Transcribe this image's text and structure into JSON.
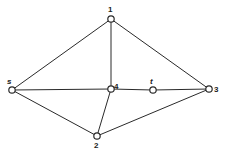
{
  "graph": {
    "type": "undirected",
    "nodes": [
      {
        "id": "1",
        "label": "1",
        "x": 111,
        "y": 19,
        "lx": 110,
        "ly": 11
      },
      {
        "id": "s",
        "label": "s",
        "x": 12,
        "y": 90,
        "lx": 9,
        "ly": 83
      },
      {
        "id": "4",
        "label": "4",
        "x": 111,
        "y": 89,
        "lx": 115,
        "ly": 88
      },
      {
        "id": "t",
        "label": "t",
        "x": 153,
        "y": 90,
        "lx": 151,
        "ly": 83
      },
      {
        "id": "3",
        "label": "3",
        "x": 209,
        "y": 89,
        "lx": 215,
        "ly": 93
      },
      {
        "id": "2",
        "label": "2",
        "x": 97,
        "y": 136,
        "lx": 95,
        "ly": 148
      }
    ],
    "edges": [
      {
        "from": "s",
        "to": "1"
      },
      {
        "from": "1",
        "to": "4"
      },
      {
        "from": "1",
        "to": "3"
      },
      {
        "from": "s",
        "to": "4"
      },
      {
        "from": "4",
        "to": "t"
      },
      {
        "from": "t",
        "to": "3"
      },
      {
        "from": "s",
        "to": "2"
      },
      {
        "from": "4",
        "to": "2"
      },
      {
        "from": "2",
        "to": "3"
      }
    ]
  },
  "labels": {
    "n1": "1",
    "ns": "s",
    "n4": "4",
    "nt": "t",
    "n3": "3",
    "n2": "2"
  }
}
